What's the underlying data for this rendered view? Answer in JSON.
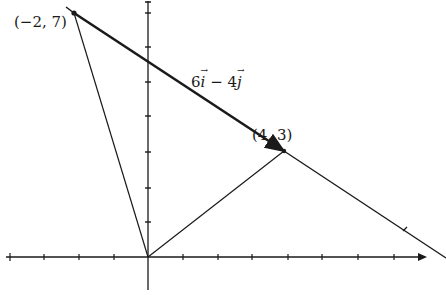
{
  "diagram": {
    "title": "",
    "colors": {
      "ink": "#1a1a1a",
      "background": "#ffffff"
    },
    "coordinate_system": {
      "origin_px": [
        148,
        257
      ],
      "unit_px": 35,
      "x_ticks": [
        -4,
        -3,
        -2,
        -1,
        1,
        2,
        3,
        4,
        5,
        6,
        7
      ],
      "y_ticks": [
        1,
        2,
        3,
        4,
        5,
        6,
        7
      ],
      "x_axis_arrow": true,
      "y_axis_arrow": true
    },
    "points": [
      {
        "name": "P",
        "coords": [
          -2,
          7
        ],
        "label": "(−2, 7)"
      },
      {
        "name": "Q",
        "coords": [
          4,
          3
        ],
        "label": "(4, 3)"
      }
    ],
    "segments": [
      {
        "from": [
          0,
          0
        ],
        "to": [
          -2,
          7
        ],
        "style": "thin"
      },
      {
        "from": [
          0,
          0
        ],
        "to": [
          4,
          3
        ],
        "style": "thin"
      },
      {
        "from": [
          -2,
          7
        ],
        "to": [
          4,
          3
        ],
        "style": "thick-arrow",
        "label": "6i − 4j"
      },
      {
        "from": [
          4,
          3
        ],
        "to": [
          8.5,
          0
        ],
        "style": "thin-extension"
      }
    ],
    "vector_label": {
      "coef_i": "6",
      "i": "i",
      "minus": " − ",
      "coef_j": "4",
      "j": "j"
    }
  }
}
